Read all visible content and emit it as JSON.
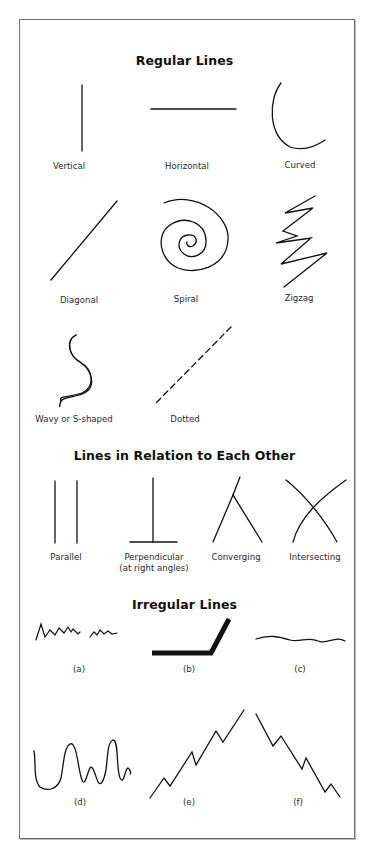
{
  "sections": [
    {
      "title": "Regular Lines",
      "items": [
        {
          "id": "vertical",
          "label": "Vertical"
        },
        {
          "id": "horizontal",
          "label": "Horizontal"
        },
        {
          "id": "curved",
          "label": "Curved"
        },
        {
          "id": "diagonal",
          "label": "Diagonal"
        },
        {
          "id": "spiral",
          "label": "Spiral"
        },
        {
          "id": "zigzag",
          "label": "Zigzag"
        },
        {
          "id": "wavy",
          "label": "Wavy or S-shaped"
        },
        {
          "id": "dotted",
          "label": "Dotted"
        }
      ]
    },
    {
      "title": "Lines in Relation to Each Other",
      "items": [
        {
          "id": "parallel",
          "label": "Parallel"
        },
        {
          "id": "perpendicular",
          "label": "Perpendicular",
          "sublabel": "(at right angles)"
        },
        {
          "id": "converging",
          "label": "Converging"
        },
        {
          "id": "intersecting",
          "label": "Intersecting"
        }
      ]
    },
    {
      "title": "Irregular Lines",
      "items": [
        {
          "id": "a",
          "label": "(a)"
        },
        {
          "id": "b",
          "label": "(b)"
        },
        {
          "id": "c",
          "label": "(c)"
        },
        {
          "id": "d",
          "label": "(d)"
        },
        {
          "id": "e",
          "label": "(e)"
        },
        {
          "id": "f",
          "label": "(f)"
        }
      ]
    }
  ],
  "colors": {
    "ink": "#111111",
    "frame": "#6e6e6e",
    "background": "#ffffff"
  }
}
